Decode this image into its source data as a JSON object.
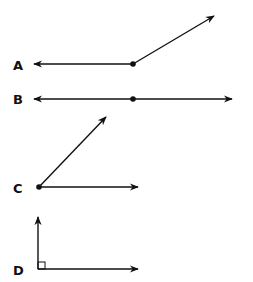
{
  "figures": [
    {
      "label": "A",
      "type": "angle",
      "description": "obtuse angle (ray left and ray up-right from vertex)"
    },
    {
      "label": "B",
      "type": "line",
      "description": "straight line with a point, arrows both ends"
    },
    {
      "label": "C",
      "type": "angle",
      "description": "acute angle"
    },
    {
      "label": "D",
      "type": "angle",
      "description": "right angle with square marker"
    }
  ],
  "colors": {
    "stroke": "#111111",
    "background": "#ffffff"
  }
}
